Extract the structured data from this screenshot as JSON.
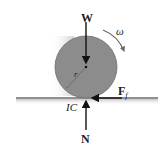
{
  "diagram": {
    "type": "free-body diagram",
    "labels": {
      "weight": "W",
      "angular_velocity": "ω",
      "radius": "r",
      "friction": "F",
      "friction_subscript": "f",
      "instant_center": "IC",
      "normal": "N"
    },
    "colors": {
      "disk": "#8c8c8c",
      "ground": "#9a9a9a",
      "arrow": "#111111",
      "shadow": "#d9d9d9"
    }
  }
}
